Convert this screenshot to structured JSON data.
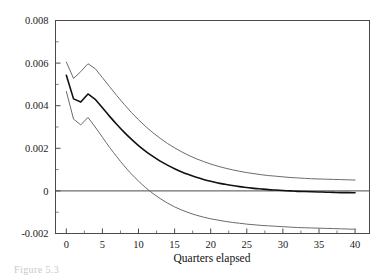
{
  "figure": {
    "caption_fragment": "Figure 5.3"
  },
  "chart_data": {
    "type": "line",
    "title": "",
    "subtitle": "",
    "xlabel": "Quarters elapsed",
    "ylabel": "",
    "xlim": [
      -1.5,
      42
    ],
    "ylim": [
      -0.002,
      0.008
    ],
    "grid": false,
    "legend": null,
    "legend_position": "none",
    "x_ticks": [
      0,
      5,
      10,
      15,
      20,
      25,
      30,
      35,
      40
    ],
    "x_tick_labels": [
      "0",
      "5",
      "10",
      "15",
      "20",
      "25",
      "30",
      "35",
      "40"
    ],
    "x_minor_ticks": [
      2.5,
      7.5,
      12.5,
      17.5,
      22.5,
      27.5,
      32.5,
      37.5
    ],
    "y_ticks": [
      -0.002,
      0,
      0.002,
      0.004,
      0.006,
      0.008
    ],
    "y_tick_labels": [
      "-0.002",
      "0",
      "0.002",
      "0.004",
      "0.006",
      "0.008"
    ],
    "y_minor_ticks": [
      -0.001,
      0.001,
      0.003,
      0.005,
      0.007
    ],
    "zero_line": 0,
    "x": [
      0,
      1,
      2,
      3,
      4,
      5,
      6,
      7,
      8,
      9,
      10,
      11,
      12,
      13,
      14,
      15,
      16,
      17,
      18,
      19,
      20,
      21,
      22,
      23,
      24,
      25,
      26,
      27,
      28,
      29,
      30,
      31,
      32,
      33,
      34,
      35,
      36,
      37,
      38,
      39,
      40
    ],
    "series": [
      {
        "name": "upper-confidence-band",
        "color": "#6b6b6b",
        "width": 1.0,
        "values": [
          0.00605,
          0.00528,
          0.0056,
          0.00597,
          0.00574,
          0.00532,
          0.00489,
          0.00447,
          0.00407,
          0.00369,
          0.00334,
          0.00302,
          0.00273,
          0.00247,
          0.00223,
          0.00202,
          0.00183,
          0.00166,
          0.00151,
          0.00138,
          0.00126,
          0.00116,
          0.00107,
          0.00099,
          0.00092,
          0.00086,
          0.00081,
          0.00076,
          0.00072,
          0.00069,
          0.00066,
          0.00063,
          0.00061,
          0.00059,
          0.00057,
          0.00056,
          0.00055,
          0.00054,
          0.00053,
          0.00052,
          0.00051
        ]
      },
      {
        "name": "point-estimate",
        "color": "#111111",
        "width": 1.6,
        "values": [
          0.00543,
          0.00432,
          0.00417,
          0.00455,
          0.0043,
          0.0039,
          0.0035,
          0.00312,
          0.00276,
          0.00243,
          0.00213,
          0.00186,
          0.00162,
          0.0014,
          0.00121,
          0.00104,
          0.00089,
          0.00076,
          0.00064,
          0.00054,
          0.00045,
          0.00037,
          0.00031,
          0.00025,
          0.0002,
          0.00016,
          0.00012,
          9e-05,
          6e-05,
          4e-05,
          2e-05,
          0.0,
          -2e-05,
          -3e-05,
          -4e-05,
          -5e-05,
          -6e-05,
          -7e-05,
          -8e-05,
          -8e-05,
          -9e-05
        ]
      },
      {
        "name": "lower-confidence-band",
        "color": "#6b6b6b",
        "width": 1.0,
        "values": [
          0.00467,
          0.00337,
          0.0031,
          0.00345,
          0.003,
          0.00252,
          0.00204,
          0.0016,
          0.00118,
          0.0008,
          0.00046,
          0.00015,
          -0.00012,
          -0.00036,
          -0.00057,
          -0.00075,
          -0.0009,
          -0.00103,
          -0.00114,
          -0.00123,
          -0.00131,
          -0.00137,
          -0.00143,
          -0.00148,
          -0.00152,
          -0.00156,
          -0.00159,
          -0.00162,
          -0.00164,
          -0.00166,
          -0.00168,
          -0.0017,
          -0.00172,
          -0.00173,
          -0.00174,
          -0.00175,
          -0.00176,
          -0.00177,
          -0.00178,
          -0.00179,
          -0.0018
        ]
      }
    ]
  }
}
